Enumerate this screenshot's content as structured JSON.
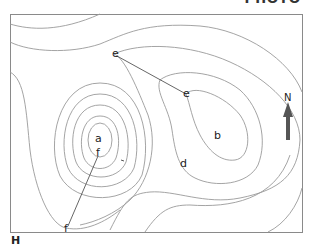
{
  "figure": {
    "type": "topographic contour map",
    "header_fragment": "PHOTO",
    "corner_label": "H",
    "north_label": "N",
    "points": [
      {
        "id": "a",
        "label": "a",
        "x": 99,
        "y": 139
      },
      {
        "id": "b",
        "label": "b",
        "x": 218,
        "y": 135
      },
      {
        "id": "d",
        "label": "d",
        "x": 184,
        "y": 163
      },
      {
        "id": "e1",
        "label": "e",
        "x": 114,
        "y": 54
      },
      {
        "id": "e2",
        "label": "e",
        "x": 186,
        "y": 94
      },
      {
        "id": "f1",
        "label": "f",
        "x": 98,
        "y": 153
      },
      {
        "id": "f2",
        "label": "f",
        "x": 66,
        "y": 229
      }
    ],
    "lines": [
      {
        "from": "e1",
        "to": "e2",
        "label": "e–e"
      },
      {
        "from": "f1",
        "to": "f2",
        "label": "f–f"
      }
    ],
    "colors": {
      "contour": "#9a9a9a",
      "frame": "#8a8a8a",
      "section_line": "#555555",
      "arrow": "#555555",
      "text": "#222222"
    }
  }
}
